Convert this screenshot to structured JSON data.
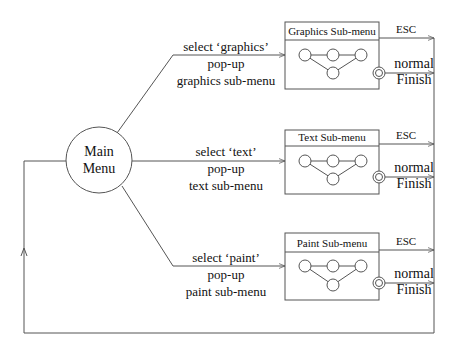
{
  "diagram": {
    "main_node": {
      "label_line1": "Main",
      "label_line2": "Menu"
    },
    "transitions": [
      {
        "line1": "select ‘graphics’",
        "line2": "pop-up",
        "line3": "graphics sub-menu"
      },
      {
        "line1": "select ‘text’",
        "line2": "pop-up",
        "line3": "text sub-menu"
      },
      {
        "line1": "select ‘paint’",
        "line2": "pop-up",
        "line3": "paint sub-menu"
      }
    ],
    "submenus": [
      {
        "title": "Graphics Sub-menu",
        "esc_label": "ESC",
        "finish_line1": "normal",
        "finish_line2": "Finish"
      },
      {
        "title": "Text Sub-menu",
        "esc_label": "ESC",
        "finish_line1": "normal",
        "finish_line2": "Finish"
      },
      {
        "title": "Paint Sub-menu",
        "esc_label": "ESC",
        "finish_line1": "normal",
        "finish_line2": "Finish"
      }
    ],
    "colors": {
      "stroke": "#555555",
      "text": "#111111",
      "background": "#ffffff"
    }
  }
}
